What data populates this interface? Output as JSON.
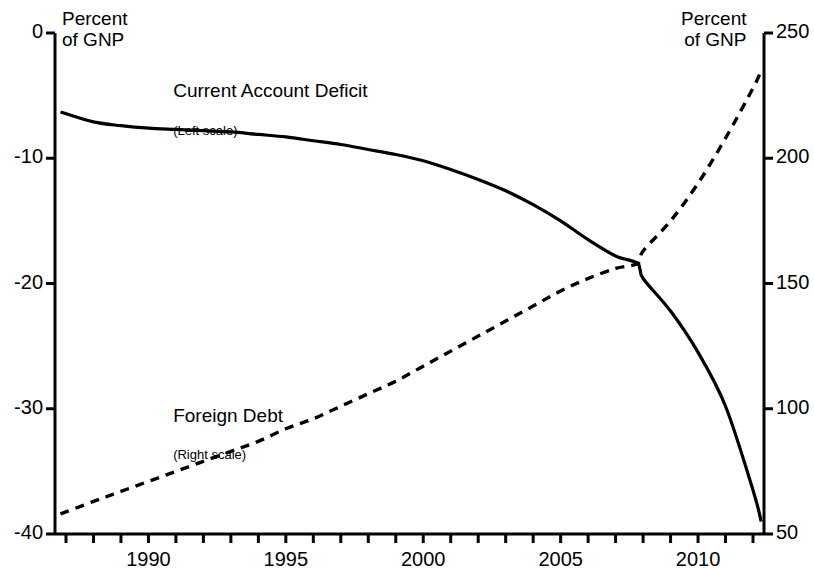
{
  "chart_data": {
    "type": "line",
    "title": "",
    "xlabel": "",
    "ylabel": "Percent of GNP",
    "y2label": "Percent of GNP",
    "grid": false,
    "legend": "inline-annotations",
    "xlim": [
      1986.6,
      2012.4
    ],
    "ylim": [
      -40,
      0
    ],
    "y2lim": [
      50,
      250
    ],
    "x_ticks": [
      1990,
      1995,
      2000,
      2005,
      2010
    ],
    "x_minor_ticks": [
      1987,
      1988,
      1989,
      1990,
      1991,
      1992,
      1993,
      1994,
      1995,
      1996,
      1997,
      1998,
      1999,
      2000,
      2001,
      2002,
      2003,
      2004,
      2005,
      2006,
      2007,
      2008,
      2009,
      2010,
      2011,
      2012
    ],
    "y_ticks": [
      0,
      -10,
      -20,
      -30,
      -40
    ],
    "y2_ticks": [
      250,
      200,
      150,
      100,
      50
    ],
    "series": [
      {
        "name": "Current Account Deficit",
        "scale": "left",
        "style": "solid",
        "color": "#000000",
        "x": [
          1986.8,
          1988,
          1989,
          1990,
          1991,
          1992,
          1993,
          1994,
          1995,
          1996,
          1997,
          1998,
          1999,
          2000,
          2001,
          2002,
          2003,
          2004,
          2005,
          2006,
          2007,
          2007.8,
          2008,
          2009,
          2010,
          2011,
          2012,
          2012.3
        ],
        "y": [
          -6.3,
          -7.1,
          -7.4,
          -7.6,
          -7.7,
          -7.8,
          -7.9,
          -8.1,
          -8.3,
          -8.6,
          -8.9,
          -9.3,
          -9.7,
          -10.2,
          -10.9,
          -11.7,
          -12.6,
          -13.7,
          -15.0,
          -16.5,
          -17.8,
          -18.4,
          -19.6,
          -22.2,
          -25.5,
          -29.8,
          -36.5,
          -39.0
        ]
      },
      {
        "name": "Foreign Debt",
        "scale": "right",
        "style": "dashed",
        "color": "#000000",
        "x": [
          1986.8,
          1988,
          1989,
          1990,
          1991,
          1992,
          1993,
          1994,
          1995,
          1996,
          1997,
          1998,
          1999,
          2000,
          2001,
          2002,
          2003,
          2004,
          2005,
          2006,
          2007,
          2007.8,
          2008,
          2009,
          2010,
          2011,
          2012,
          2012.3
        ],
        "y": [
          58,
          63,
          67,
          71,
          75,
          79,
          83,
          87,
          92,
          96,
          101,
          106,
          111,
          117,
          123,
          129,
          135,
          141,
          147,
          152,
          156,
          158,
          163,
          175,
          190,
          208,
          228,
          235
        ]
      }
    ],
    "annotations": [
      {
        "text": "Current Account Deficit",
        "x": 1990.9,
        "y": -4.8,
        "role": "series-label"
      },
      {
        "text": "(Left scale)",
        "x": 1990.9,
        "y": -7.9,
        "role": "series-sublabel"
      },
      {
        "text": "Foreign Debt",
        "x": 1990.9,
        "y": -30.7,
        "role": "series-label"
      },
      {
        "text": "(Right scale)",
        "x": 1990.9,
        "y": -33.8,
        "role": "series-sublabel"
      }
    ]
  },
  "labels": {
    "left_axis_title": "Percent\nof GNP",
    "right_axis_title": "Percent\nof GNP",
    "y_left": [
      "0",
      "-10",
      "-20",
      "-30",
      "-40"
    ],
    "y_right": [
      "250",
      "200",
      "150",
      "100",
      "50"
    ],
    "x": [
      "1990",
      "1995",
      "2000",
      "2005",
      "2010"
    ],
    "series1_name": "Current Account Deficit",
    "series1_scale": "(Left scale)",
    "series2_name": "Foreign Debt",
    "series2_scale": "(Right scale)"
  },
  "colors": {
    "axis": "#000000",
    "series1": "#000000",
    "series2": "#000000",
    "background": "#ffffff"
  }
}
